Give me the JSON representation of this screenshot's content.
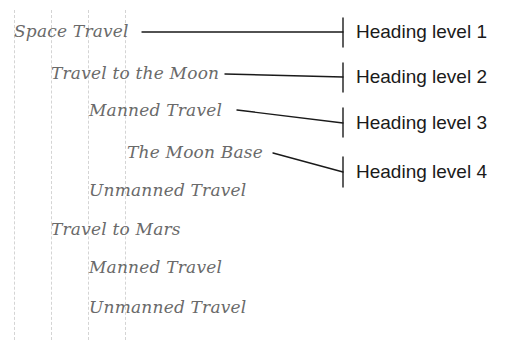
{
  "outline": {
    "items": [
      {
        "text": "Space Travel",
        "level": 1
      },
      {
        "text": "Travel to the Moon",
        "level": 2
      },
      {
        "text": "Manned Travel",
        "level": 3
      },
      {
        "text": "The Moon Base",
        "level": 4
      },
      {
        "text": "Unmanned Travel",
        "level": 3
      },
      {
        "text": "Travel to Mars",
        "level": 2
      },
      {
        "text": "Manned Travel",
        "level": 3
      },
      {
        "text": "Unmanned Travel",
        "level": 3
      }
    ]
  },
  "labels": [
    {
      "text": "Heading level 1"
    },
    {
      "text": "Heading level 2"
    },
    {
      "text": "Heading level 3"
    },
    {
      "text": "Heading level 4"
    }
  ],
  "colors": {
    "outline_text": "#6a6a6a",
    "label_text": "#1a1a1a",
    "connector": "#1a1a1a",
    "guide": "#d4d4d4"
  }
}
